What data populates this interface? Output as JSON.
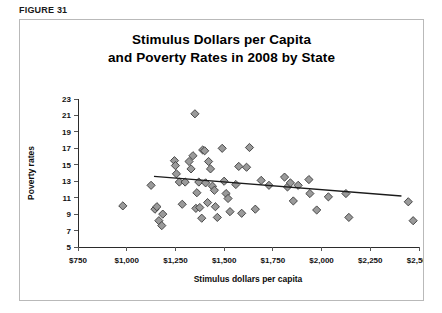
{
  "figure": {
    "label": "FIGURE 31"
  },
  "chart_data": {
    "type": "scatter",
    "title": "Stimulus Dollars per Capita and Poverty Rates in 2008 by State",
    "title_lines": [
      "Stimulus Dollars per Capita",
      "and Poverty Rates in 2008 by State"
    ],
    "xlabel": "Stimulus dollars per capita",
    "ylabel": "Poverty rates",
    "xlim": [
      750,
      2500
    ],
    "ylim": [
      5,
      23
    ],
    "xticks": [
      750,
      1000,
      1250,
      1500,
      1750,
      2000,
      2250,
      2500
    ],
    "xticklabels": [
      "$750",
      "$1,000",
      "$1,250",
      "$1,500",
      "$1,750",
      "$2,000",
      "$2,250",
      "$2,500"
    ],
    "yticks": [
      5,
      7,
      9,
      11,
      13,
      15,
      17,
      19,
      21,
      23
    ],
    "yticklabels": [
      "5",
      "7",
      "9",
      "11",
      "13",
      "15",
      "17",
      "19",
      "21",
      "23"
    ],
    "grid": false,
    "legend": false,
    "marker": "diamond",
    "marker_fill": "#9a9a9a",
    "marker_edge": "#3a3a3a",
    "points": [
      {
        "x": 980,
        "y": 10.0
      },
      {
        "x": 1125,
        "y": 12.5
      },
      {
        "x": 1145,
        "y": 9.6
      },
      {
        "x": 1155,
        "y": 9.9
      },
      {
        "x": 1165,
        "y": 8.2
      },
      {
        "x": 1185,
        "y": 9.0
      },
      {
        "x": 1180,
        "y": 7.6
      },
      {
        "x": 1245,
        "y": 15.5
      },
      {
        "x": 1250,
        "y": 14.9
      },
      {
        "x": 1255,
        "y": 13.9
      },
      {
        "x": 1270,
        "y": 12.9
      },
      {
        "x": 1285,
        "y": 10.2
      },
      {
        "x": 1300,
        "y": 12.9
      },
      {
        "x": 1320,
        "y": 15.4
      },
      {
        "x": 1330,
        "y": 14.5
      },
      {
        "x": 1340,
        "y": 16.1
      },
      {
        "x": 1350,
        "y": 21.2
      },
      {
        "x": 1355,
        "y": 9.7
      },
      {
        "x": 1360,
        "y": 11.6
      },
      {
        "x": 1370,
        "y": 12.9
      },
      {
        "x": 1375,
        "y": 9.8
      },
      {
        "x": 1385,
        "y": 8.5
      },
      {
        "x": 1390,
        "y": 16.8
      },
      {
        "x": 1400,
        "y": 16.7
      },
      {
        "x": 1405,
        "y": 12.8
      },
      {
        "x": 1415,
        "y": 10.4
      },
      {
        "x": 1420,
        "y": 15.4
      },
      {
        "x": 1430,
        "y": 14.5
      },
      {
        "x": 1440,
        "y": 12.4
      },
      {
        "x": 1450,
        "y": 11.9
      },
      {
        "x": 1455,
        "y": 9.9
      },
      {
        "x": 1465,
        "y": 8.6
      },
      {
        "x": 1490,
        "y": 17.0
      },
      {
        "x": 1500,
        "y": 13.0
      },
      {
        "x": 1510,
        "y": 11.5
      },
      {
        "x": 1520,
        "y": 10.9
      },
      {
        "x": 1530,
        "y": 9.3
      },
      {
        "x": 1560,
        "y": 12.6
      },
      {
        "x": 1575,
        "y": 14.8
      },
      {
        "x": 1590,
        "y": 9.1
      },
      {
        "x": 1615,
        "y": 14.7
      },
      {
        "x": 1630,
        "y": 17.1
      },
      {
        "x": 1660,
        "y": 9.6
      },
      {
        "x": 1690,
        "y": 13.1
      },
      {
        "x": 1730,
        "y": 12.5
      },
      {
        "x": 1810,
        "y": 13.5
      },
      {
        "x": 1825,
        "y": 12.3
      },
      {
        "x": 1840,
        "y": 12.8
      },
      {
        "x": 1855,
        "y": 10.6
      },
      {
        "x": 1880,
        "y": 12.5
      },
      {
        "x": 1935,
        "y": 13.2
      },
      {
        "x": 1940,
        "y": 11.5
      },
      {
        "x": 1975,
        "y": 9.5
      },
      {
        "x": 2035,
        "y": 11.1
      },
      {
        "x": 2125,
        "y": 11.5
      },
      {
        "x": 2140,
        "y": 8.6
      },
      {
        "x": 2445,
        "y": 10.5
      },
      {
        "x": 2470,
        "y": 8.2
      }
    ],
    "trendline": {
      "description": "linear fit, negative slope",
      "x_start": 1140,
      "y_start": 13.6,
      "x_end": 2410,
      "y_end": 11.2
    }
  }
}
